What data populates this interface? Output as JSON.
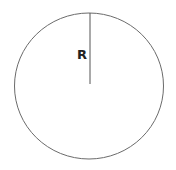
{
  "diagram": {
    "radius_label": "R",
    "circle": {
      "cx": 89,
      "cy": 86,
      "rx": 74.5,
      "ry": 73,
      "stroke": "#6b6b6b"
    },
    "radius_line": {
      "x1": 90,
      "y1": 13,
      "x2": 90,
      "y2": 84,
      "stroke": "#555555"
    }
  }
}
